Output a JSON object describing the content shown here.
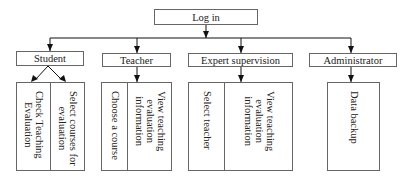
{
  "root": {
    "label": "Log in"
  },
  "roles": [
    {
      "label": "Student",
      "functions": [
        "Select courses for\nevaluation",
        "Check Teaching\nEvaluation"
      ]
    },
    {
      "label": "Teacher",
      "functions": [
        "View teaching\nevaluation\ninformation",
        "Choose a course"
      ]
    },
    {
      "label": "Expert supervision",
      "functions": [
        "View teaching\nevaluation\ninformation",
        "Select teacher"
      ]
    },
    {
      "label": "Administrator",
      "functions": [
        "Data backup"
      ]
    }
  ],
  "colors": {
    "line": "#111111",
    "border": "#666666",
    "text": "#222222"
  }
}
